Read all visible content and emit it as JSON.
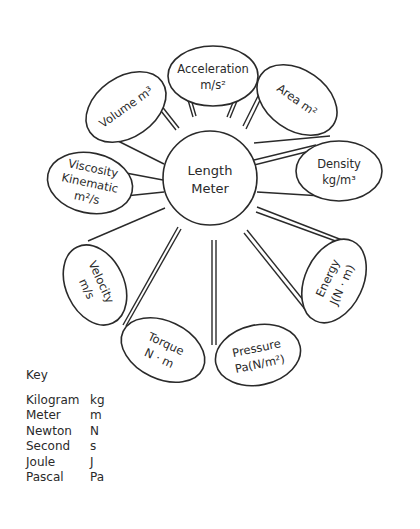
{
  "center": {
    "line1": "Length",
    "line2": "Meter"
  },
  "petals": [
    {
      "id": "acceleration",
      "line1": "Acceleration",
      "line2": "m/s²"
    },
    {
      "id": "area",
      "line1": "Area m²",
      "line2": ""
    },
    {
      "id": "density",
      "line1": "Density",
      "line2": "kg/m³"
    },
    {
      "id": "energy",
      "line1": "Energy",
      "line2": "J(N · m)"
    },
    {
      "id": "pressure",
      "line1": "Pressure",
      "line2": "Pa(N/m²)"
    },
    {
      "id": "torque",
      "line1": "Torque",
      "line2": "N · m"
    },
    {
      "id": "velocity",
      "line1": "Velocity",
      "line2": "m/s"
    },
    {
      "id": "viscosity",
      "line1": "Viscosity",
      "line2": "Kinematic",
      "line3": "m²/s"
    },
    {
      "id": "volume",
      "line1": "Volume m³",
      "line2": ""
    }
  ],
  "key": {
    "title": "Key",
    "rows": [
      {
        "name": "Kilogram",
        "symbol": "kg"
      },
      {
        "name": "Meter",
        "symbol": "m"
      },
      {
        "name": "Newton",
        "symbol": "N"
      },
      {
        "name": "Second",
        "symbol": "s"
      },
      {
        "name": "Joule",
        "symbol": "J"
      },
      {
        "name": "Pascal",
        "symbol": "Pa"
      }
    ]
  }
}
